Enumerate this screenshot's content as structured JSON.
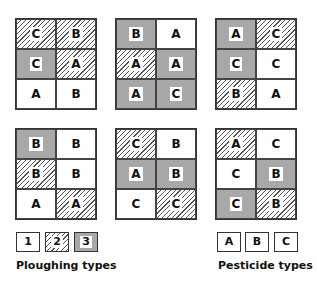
{
  "plots": [
    {
      "position": "top-left",
      "cells": [
        {
          "pesticide": "C",
          "ploughing": 2
        },
        {
          "pesticide": "B",
          "ploughing": 2
        },
        {
          "pesticide": "C",
          "ploughing": 3
        },
        {
          "pesticide": "A",
          "ploughing": 2
        },
        {
          "pesticide": "A",
          "ploughing": 1
        },
        {
          "pesticide": "B",
          "ploughing": 1
        }
      ]
    },
    {
      "position": "top-middle",
      "cells": [
        {
          "pesticide": "B",
          "ploughing": 3
        },
        {
          "pesticide": "A",
          "ploughing": 1
        },
        {
          "pesticide": "A",
          "ploughing": 2
        },
        {
          "pesticide": "A",
          "ploughing": 3
        },
        {
          "pesticide": "A",
          "ploughing": 3
        },
        {
          "pesticide": "C",
          "ploughing": 3
        }
      ]
    },
    {
      "position": "top-right",
      "cells": [
        {
          "pesticide": "A",
          "ploughing": 3
        },
        {
          "pesticide": "C",
          "ploughing": 2
        },
        {
          "pesticide": "C",
          "ploughing": 3
        },
        {
          "pesticide": "C",
          "ploughing": 1
        },
        {
          "pesticide": "B",
          "ploughing": 2
        },
        {
          "pesticide": "A",
          "ploughing": 1
        }
      ]
    },
    {
      "position": "bottom-left",
      "cells": [
        {
          "pesticide": "B",
          "ploughing": 3
        },
        {
          "pesticide": "B",
          "ploughing": 1
        },
        {
          "pesticide": "B",
          "ploughing": 2
        },
        {
          "pesticide": "B",
          "ploughing": 1
        },
        {
          "pesticide": "A",
          "ploughing": 1
        },
        {
          "pesticide": "A",
          "ploughing": 2
        }
      ]
    },
    {
      "position": "bottom-middle",
      "cells": [
        {
          "pesticide": "C",
          "ploughing": 2
        },
        {
          "pesticide": "B",
          "ploughing": 1
        },
        {
          "pesticide": "A",
          "ploughing": 3
        },
        {
          "pesticide": "B",
          "ploughing": 3
        },
        {
          "pesticide": "C",
          "ploughing": 1
        },
        {
          "pesticide": "C",
          "ploughing": 2
        }
      ]
    },
    {
      "position": "bottom-right",
      "cells": [
        {
          "pesticide": "A",
          "ploughing": 2
        },
        {
          "pesticide": "C",
          "ploughing": 1
        },
        {
          "pesticide": "C",
          "ploughing": 1
        },
        {
          "pesticide": "B",
          "ploughing": 3
        },
        {
          "pesticide": "C",
          "ploughing": 3
        },
        {
          "pesticide": "B",
          "ploughing": 2
        }
      ]
    }
  ],
  "legend": {
    "ploughing": {
      "title": "Ploughing types",
      "items": [
        {
          "label": "1",
          "style": "white"
        },
        {
          "label": "2",
          "style": "hatched"
        },
        {
          "label": "3",
          "style": "grey"
        }
      ]
    },
    "pesticide": {
      "title": "Pesticide types",
      "items": [
        {
          "label": "A"
        },
        {
          "label": "B"
        },
        {
          "label": "C"
        }
      ]
    }
  },
  "colors": {
    "grey_fill": "#a8a8a8",
    "border": "#333333",
    "hatch": "#555555"
  }
}
